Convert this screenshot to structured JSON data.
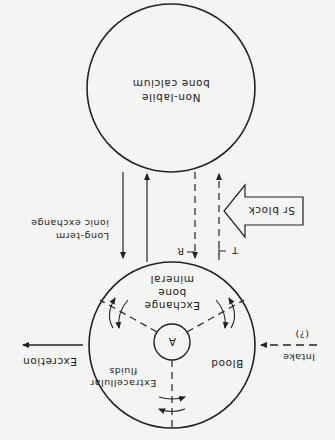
{
  "figure": {
    "orientation": "rotated-180",
    "compartments": {
      "non_labile": {
        "line1": "Non-labile",
        "line2": "bone calcium"
      },
      "exchange_pool": {
        "center_label": "A",
        "blood": "Blood",
        "extracellular": {
          "line1": "Extracellular",
          "line2": "fluids"
        },
        "exchange_bone": {
          "line1": "Exchange",
          "line2": "bone",
          "line3": "mineral"
        }
      }
    },
    "labels": {
      "long_term": {
        "line1": "Long-term",
        "line2": "ionic exchange"
      },
      "sr_block": "Sr block",
      "excretion": "Excretion",
      "intake": "Intake",
      "intake_note": "(?)",
      "R": "R",
      "T": "T"
    },
    "colors": {
      "ink": "#222222",
      "paper": "#f4f4f2"
    }
  }
}
